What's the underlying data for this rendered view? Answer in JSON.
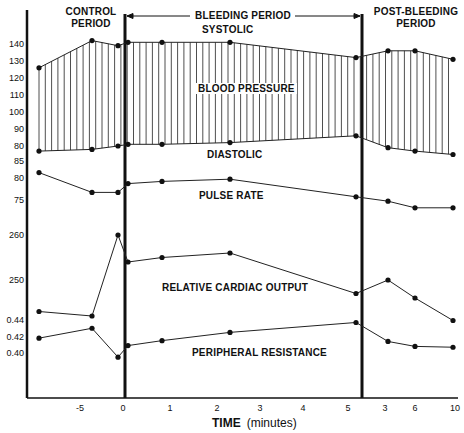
{
  "chart_data": {
    "type": "line",
    "title": "",
    "xlabel": "TIME (minutes)",
    "ylabel": "",
    "periods": [
      {
        "label": "CONTROL PERIOD",
        "lines": [
          "CONTROL",
          "PERIOD"
        ]
      },
      {
        "label": "BLEEDING PERIOD",
        "lines": [
          "BLEEDING PERIOD"
        ]
      },
      {
        "label": "POST-BLEEDING PERIOD",
        "lines": [
          "POST-BLEEDING",
          "PERIOD"
        ]
      }
    ],
    "x_tick_labels": [
      "-5",
      "0",
      "1",
      "2",
      "3",
      "4",
      "5",
      "3",
      "6",
      "10"
    ],
    "y_tick_labels": {
      "blood_pressure": [
        "140",
        "130",
        "120",
        "110",
        "100",
        "90",
        "80"
      ],
      "pulse_rate": [
        "85",
        "80",
        "75"
      ],
      "relative_cardiac_output": [
        "260",
        "250"
      ],
      "peripheral_resistance": [
        "0.44",
        "0.42",
        "0.40"
      ]
    },
    "x_points": [
      "-8",
      "-5",
      "-0.3",
      "0.2",
      "1",
      "2.4",
      "5.2",
      "3",
      "6",
      "10"
    ],
    "series": [
      {
        "name": "SYSTOLIC",
        "group": "BLOOD PRESSURE",
        "unit": "mmHg",
        "values": [
          126,
          142,
          139,
          141,
          141,
          141,
          132,
          136,
          136,
          131
        ]
      },
      {
        "name": "DIASTOLIC",
        "group": "BLOOD PRESSURE",
        "unit": "mmHg",
        "values": [
          77,
          78,
          80,
          81,
          81,
          82,
          86,
          79,
          77,
          75
        ]
      },
      {
        "name": "PULSE RATE",
        "unit": "beats/min",
        "values": [
          81,
          76.5,
          76.5,
          78.5,
          79,
          79.5,
          75.5,
          74.5,
          73,
          73
        ]
      },
      {
        "name": "RELATIVE CARDIAC OUTPUT",
        "unit": "relative",
        "values": [
          243,
          242,
          260,
          254,
          255,
          256,
          247,
          250,
          246,
          241
        ]
      },
      {
        "name": "PERIPHERAL RESISTANCE",
        "unit": "relative",
        "values": [
          0.418,
          0.43,
          0.395,
          0.409,
          0.415,
          0.425,
          0.437,
          0.414,
          0.408,
          0.407
        ]
      }
    ],
    "annotations": [
      "SYSTOLIC",
      "BLOOD PRESSURE",
      "DIASTOLIC",
      "PULSE RATE",
      "RELATIVE CARDIAC OUTPUT",
      "PERIPHERAL RESISTANCE"
    ],
    "grid": false,
    "legend": "inline labels"
  },
  "labels": {
    "control_1": "CONTROL",
    "control_2": "PERIOD",
    "bleeding": "BLEEDING PERIOD",
    "post_1": "POST-BLEEDING",
    "post_2": "PERIOD",
    "systolic": "SYSTOLIC",
    "blood_pressure": "BLOOD PRESSURE",
    "diastolic": "DIASTOLIC",
    "pulse_rate": "PULSE RATE",
    "cardiac_output": "RELATIVE CARDIAC OUTPUT",
    "peripheral_resistance": "PERIPHERAL RESISTANCE",
    "x_axis_title": "TIME",
    "x_axis_unit": "(minutes)"
  },
  "ticks": {
    "y": [
      "140",
      "130",
      "120",
      "110",
      "100",
      "90",
      "80",
      "85",
      "80",
      "75",
      "260",
      "250",
      "0.44",
      "0.42",
      "0.40"
    ],
    "x": [
      "-5",
      "0",
      "1",
      "2",
      "3",
      "4",
      "5",
      "3",
      "6",
      "10"
    ]
  }
}
